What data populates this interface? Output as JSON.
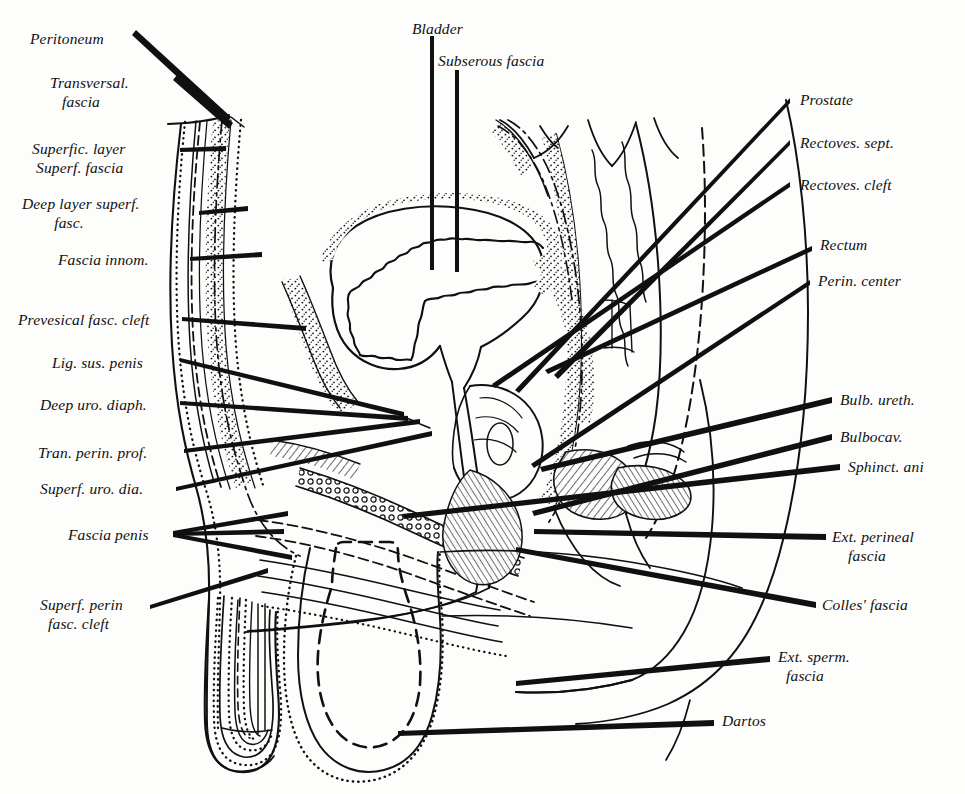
{
  "figure": {
    "style": "antique line engraving, stipple and hatch shading",
    "background_color": "#fdfdfc",
    "ink_color": "#101010"
  },
  "labels": {
    "left": [
      {
        "id": "peritoneum",
        "text": "Peritoneum",
        "x": 30,
        "y": 30,
        "align": "left"
      },
      {
        "id": "transversal-fascia",
        "text": "Transversal.\n   fascia",
        "x": 50,
        "y": 74,
        "align": "left"
      },
      {
        "id": "superfic-layer",
        "text": "Superfic. layer\n Superf. fascia",
        "x": 32,
        "y": 140,
        "align": "left"
      },
      {
        "id": "deep-layer-superf",
        "text": "Deep layer superf.\n        fasc.",
        "x": 22,
        "y": 195,
        "align": "left"
      },
      {
        "id": "fascia-innom",
        "text": "Fascia innom.",
        "x": 58,
        "y": 251,
        "align": "left"
      },
      {
        "id": "prevesical-cleft",
        "text": "Prevesical fasc. cleft",
        "x": 18,
        "y": 311,
        "align": "left"
      },
      {
        "id": "lig-sus-penis",
        "text": "Lig. sus. penis",
        "x": 52,
        "y": 354,
        "align": "left"
      },
      {
        "id": "deep-uro-diaph",
        "text": "Deep uro. diaph.",
        "x": 40,
        "y": 396,
        "align": "left"
      },
      {
        "id": "tran-perin-prof",
        "text": "Tran. perin. prof.",
        "x": 38,
        "y": 444,
        "align": "left"
      },
      {
        "id": "superf-uro-dia",
        "text": "Superf. uro. dia.",
        "x": 40,
        "y": 480,
        "align": "left"
      },
      {
        "id": "fascia-penis",
        "text": "Fascia penis",
        "x": 68,
        "y": 526,
        "align": "left"
      },
      {
        "id": "superf-perin-cleft",
        "text": "Superf. perin\n  fasc. cleft",
        "x": 40,
        "y": 596,
        "align": "left"
      }
    ],
    "top": [
      {
        "id": "bladder",
        "text": "Bladder",
        "x": 412,
        "y": 20,
        "align": "left"
      },
      {
        "id": "subserous-fascia",
        "text": "Subserous fascia",
        "x": 438,
        "y": 52,
        "align": "left"
      }
    ],
    "right": [
      {
        "id": "prostate",
        "text": "Prostate",
        "x": 800,
        "y": 91,
        "align": "left"
      },
      {
        "id": "rectoves-sept",
        "text": "Rectoves. sept.",
        "x": 800,
        "y": 134,
        "align": "left"
      },
      {
        "id": "rectoves-cleft",
        "text": "Rectoves. cleft",
        "x": 800,
        "y": 176,
        "align": "left"
      },
      {
        "id": "rectum",
        "text": "Rectum",
        "x": 820,
        "y": 236,
        "align": "left"
      },
      {
        "id": "perin-center",
        "text": "Perin. center",
        "x": 818,
        "y": 272,
        "align": "left"
      },
      {
        "id": "bulb-ureth",
        "text": "Bulb. ureth.",
        "x": 840,
        "y": 391,
        "align": "left"
      },
      {
        "id": "bulbocav",
        "text": "Bulbocav.",
        "x": 840,
        "y": 428,
        "align": "left"
      },
      {
        "id": "sphinct-ani",
        "text": "Sphinct. ani",
        "x": 848,
        "y": 458,
        "align": "left"
      },
      {
        "id": "ext-perineal-fascia",
        "text": "Ext. perineal\n    fascia",
        "x": 832,
        "y": 528,
        "align": "left"
      },
      {
        "id": "colles-fascia",
        "text": "Colles' fascia",
        "x": 822,
        "y": 596,
        "align": "left"
      },
      {
        "id": "ext-sperm-fascia",
        "text": "Ext. sperm.\n  fascia",
        "x": 778,
        "y": 648,
        "align": "left"
      },
      {
        "id": "dartos",
        "text": "Dartos",
        "x": 722,
        "y": 712,
        "align": "left"
      }
    ]
  }
}
